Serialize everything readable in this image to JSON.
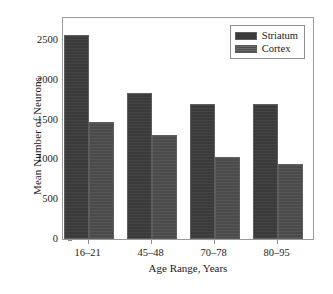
{
  "chart_data": {
    "type": "bar",
    "title": "",
    "xlabel": "Age Range, Years",
    "ylabel": "Mean Number of Neurons",
    "categories": [
      "16–21",
      "45–48",
      "70–78",
      "80–95"
    ],
    "series": [
      {
        "name": "Striatum",
        "values": [
          2560,
          1830,
          1700,
          1690
        ],
        "color": "#3a3a3a"
      },
      {
        "name": "Cortex",
        "values": [
          1475,
          1300,
          1030,
          940
        ],
        "color": "#4a4a4a"
      }
    ],
    "ylim": [
      0,
      2800
    ],
    "yticks": [
      0,
      500,
      1000,
      1500,
      2000,
      2500
    ],
    "ytick_labels": [
      "0",
      "500",
      "1000",
      "1500",
      "2000",
      "2500"
    ],
    "grid": false,
    "legend_position": "top-right"
  },
  "legend": {
    "entries": [
      {
        "label": "Striatum"
      },
      {
        "label": "Cortex"
      }
    ]
  },
  "axes": {
    "y_title": "Mean Number of Neurons",
    "x_title": "Age Range, Years"
  }
}
